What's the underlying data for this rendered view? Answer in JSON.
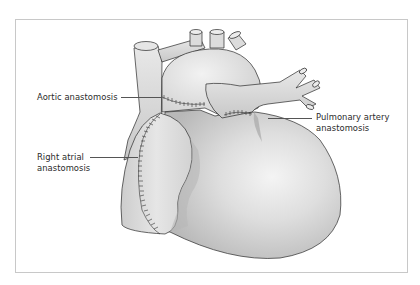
{
  "figure": {
    "labels": {
      "aortic": "Aortic anastomosis",
      "pulmonary_line1": "Pulmonary artery",
      "pulmonary_line2": "anastomosis",
      "right_atrial_line1": "Right atrial",
      "right_atrial_line2": "anastomosis"
    },
    "colors": {
      "frame_border": "#c8c8c8",
      "heart_fill": "#dcdcdc",
      "heart_shadow": "#b4b4b4",
      "outline": "#2a2a2a",
      "suture": "#333333"
    }
  }
}
